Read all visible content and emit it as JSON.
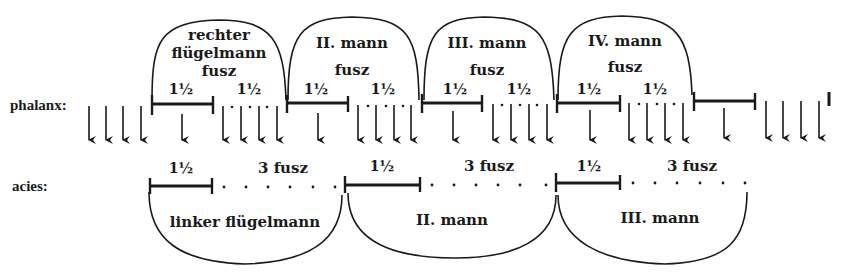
{
  "rows": {
    "phalanx": {
      "label": "phalanx:"
    },
    "acies": {
      "label": "acies:"
    }
  },
  "phalanx_men": [
    {
      "name_line1": "rechter",
      "name_line2": "flügelmann",
      "unit": "fusz",
      "span1": "1½",
      "span2": "1½"
    },
    {
      "name_line1": "II. mann",
      "unit": "fusz",
      "span1": "1½",
      "span2": "1½"
    },
    {
      "name_line1": "III. mann",
      "unit": "fusz",
      "span1": "1½",
      "span2": "1½"
    },
    {
      "name_line1": "IV. mann",
      "unit": "fusz",
      "span1": "1½",
      "span2": "1½"
    }
  ],
  "acies_men": [
    {
      "name": "linker flügelmann",
      "span1": "1½",
      "span2": "3 fusz"
    },
    {
      "name": "II. mann",
      "span1": "1½",
      "span2": "3 fusz"
    },
    {
      "name": "III. mann",
      "span1": "1½",
      "span2": "3 fusz"
    }
  ],
  "colors": {
    "ink": "#1a1a1a",
    "paper": "#ffffff"
  }
}
